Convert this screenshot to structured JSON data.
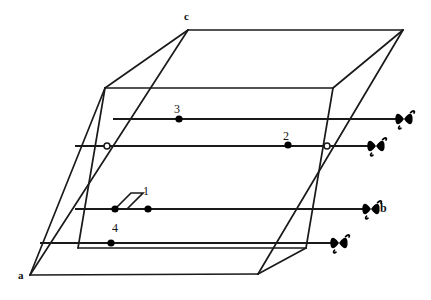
{
  "figure": {
    "stroke_color": "#1a1a1a",
    "fill_color": "#000000",
    "background": "#ffffff",
    "vertex_labels": [
      {
        "name": "a",
        "text": "a",
        "x": 18,
        "y": 270
      },
      {
        "name": "c",
        "text": "c",
        "x": 184,
        "y": 11
      }
    ],
    "ray_labels": [
      {
        "name": "b",
        "text": "b",
        "x": 380,
        "y": 202
      }
    ],
    "point_labels": [
      {
        "name": "point-1",
        "text": "1",
        "x": 143,
        "y": 185
      },
      {
        "name": "point-2",
        "text": "2",
        "x": 283,
        "y": 130
      },
      {
        "name": "point-3",
        "text": "3",
        "x": 174,
        "y": 103
      },
      {
        "name": "point-4",
        "text": "4",
        "x": 112,
        "y": 222
      }
    ],
    "solid_points": [
      {
        "name": "point-1-dot",
        "cx": 148,
        "cy": 209,
        "r": 3.6
      },
      {
        "name": "point-2-dot",
        "cx": 288,
        "cy": 145,
        "r": 3.6
      },
      {
        "name": "point-3-dot",
        "cx": 179,
        "cy": 119,
        "r": 3.6
      },
      {
        "name": "point-4-dot",
        "cx": 111,
        "cy": 243,
        "r": 3.6
      },
      {
        "name": "right-angle-vertex-dot",
        "cx": 115,
        "cy": 209,
        "r": 3.6
      }
    ],
    "hollow_points": [
      {
        "name": "hollow-marker-left",
        "cx": 107,
        "cy": 146,
        "r": 3.0
      },
      {
        "name": "hollow-marker-right",
        "cx": 327,
        "cy": 146,
        "r": 3.0
      }
    ],
    "box_edges": [
      {
        "name": "edge-a-to-c",
        "x1": 30,
        "y1": 275,
        "x2": 188,
        "y2": 30
      },
      {
        "name": "edge-a-to-left-top",
        "x1": 30,
        "y1": 275,
        "x2": 105,
        "y2": 88
      },
      {
        "name": "edge-a-to-bottom-right",
        "x1": 30,
        "y1": 275,
        "x2": 258,
        "y2": 274
      },
      {
        "name": "edge-left-top-to-c",
        "x1": 105,
        "y1": 88,
        "x2": 188,
        "y2": 30
      },
      {
        "name": "edge-c-to-top-right",
        "x1": 188,
        "y1": 30,
        "x2": 403,
        "y2": 30
      },
      {
        "name": "edge-left-top-to-mid",
        "x1": 105,
        "y1": 88,
        "x2": 333,
        "y2": 88
      },
      {
        "name": "edge-mid-to-top-right",
        "x1": 333,
        "y1": 88,
        "x2": 403,
        "y2": 30
      },
      {
        "name": "edge-front-left-slant",
        "x1": 78,
        "y1": 248,
        "x2": 105,
        "y2": 88
      },
      {
        "name": "edge-front-bottom",
        "x1": 78,
        "y1": 248,
        "x2": 306,
        "y2": 248
      },
      {
        "name": "edge-front-right-slant",
        "x1": 306,
        "y1": 248,
        "x2": 333,
        "y2": 88
      },
      {
        "name": "edge-bottom-right-up",
        "x1": 258,
        "y1": 274,
        "x2": 403,
        "y2": 30
      },
      {
        "name": "edge-bottom-right-front",
        "x1": 258,
        "y1": 274,
        "x2": 306,
        "y2": 248
      }
    ],
    "rays": [
      {
        "name": "ray-3",
        "x1": 113,
        "y1": 119,
        "x2": 398,
        "y2": 119
      },
      {
        "name": "ray-2",
        "x1": 75,
        "y1": 146,
        "x2": 370,
        "y2": 146
      },
      {
        "name": "ray-b",
        "x1": 75,
        "y1": 209,
        "x2": 365,
        "y2": 209
      },
      {
        "name": "ray-4",
        "x1": 40,
        "y1": 243,
        "x2": 333,
        "y2": 243
      }
    ],
    "arrowheads": [
      {
        "name": "arrowhead-3",
        "x": 404,
        "y": 119
      },
      {
        "name": "arrowhead-2",
        "x": 376,
        "y": 146
      },
      {
        "name": "arrowhead-b",
        "x": 371,
        "y": 209
      },
      {
        "name": "arrowhead-4",
        "x": 339,
        "y": 243
      }
    ],
    "right_angle_marker": {
      "name": "right-angle-marker",
      "points": "115,209 131,193 143,193 127,209"
    }
  }
}
